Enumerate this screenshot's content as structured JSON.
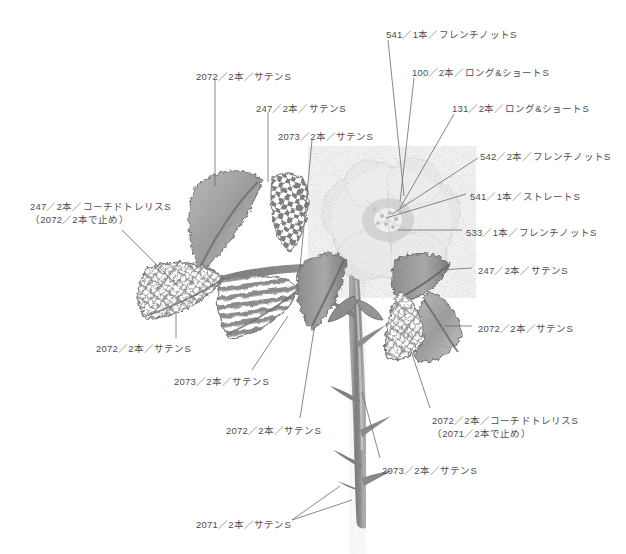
{
  "document": {
    "title": "刺繍図案 ステッチ指定図",
    "background_color": "#ffffff",
    "text_color": "#4e4e4e",
    "leader_line_color": "#6b6b6b"
  },
  "artwork": {
    "subject": "rose-embroidery-illustration",
    "palette": {
      "leaf_dark": "#7c7c7c",
      "leaf_mid": "#9a9a9a",
      "leaf_light": "#b8b8b8",
      "stem": "#8e8e8e",
      "flower_pale": "#f0f0f0",
      "flower_shadow": "#d8d8d8",
      "outline": "#6e6e6e"
    },
    "elements": [
      {
        "name": "flower-bloom",
        "stitch_ref": "100 / 131 / 541 / 542 / 533"
      },
      {
        "name": "leaf-upper-left-satin",
        "stitch_ref": "2072"
      },
      {
        "name": "leaf-checkered-upper",
        "stitch_ref": "247"
      },
      {
        "name": "leaf-trellis-left",
        "stitch_ref": "247 (2072)"
      },
      {
        "name": "leaf-striped-center",
        "stitch_ref": "2073"
      },
      {
        "name": "leaf-center-satin",
        "stitch_ref": "2072"
      },
      {
        "name": "leaf-right-upper-satin",
        "stitch_ref": "247"
      },
      {
        "name": "leaf-right-lower-satin",
        "stitch_ref": "2072"
      },
      {
        "name": "leaf-trellis-right",
        "stitch_ref": "2072 (2071)"
      },
      {
        "name": "stem-main",
        "stitch_ref": "2073"
      },
      {
        "name": "thorns",
        "stitch_ref": "2071"
      }
    ]
  },
  "labels": [
    {
      "id": "label-541-french-knot",
      "name": "label-541-french-knot",
      "line1": "541／1本／フレンチノットS",
      "color_no": "541",
      "strands": "1本",
      "stitch": "フレンチノットS",
      "x": 386,
      "y": 28
    },
    {
      "id": "label-100-long-short",
      "name": "label-100-long-and-short",
      "line1": "100／2本／ロング&ショートS",
      "color_no": "100",
      "strands": "2本",
      "stitch": "ロング&ショートS",
      "x": 412,
      "y": 66
    },
    {
      "id": "label-131-long-short",
      "name": "label-131-long-and-short",
      "line1": "131／2本／ロング&ショートS",
      "color_no": "131",
      "strands": "2本",
      "stitch": "ロング&ショートS",
      "x": 452,
      "y": 102
    },
    {
      "id": "label-542-french-knot",
      "name": "label-542-french-knot",
      "line1": "542／2本／フレンチノットS",
      "color_no": "542",
      "strands": "2本",
      "stitch": "フレンチノットS",
      "x": 480,
      "y": 150
    },
    {
      "id": "label-541-straight",
      "name": "label-541-straight",
      "line1": "541／1本／ストレートS",
      "color_no": "541",
      "strands": "1本",
      "stitch": "ストレートS",
      "x": 470,
      "y": 190
    },
    {
      "id": "label-533-french-knot",
      "name": "label-533-french-knot",
      "line1": "533／1本／フレンチノットS",
      "color_no": "533",
      "strands": "1本",
      "stitch": "フレンチノットS",
      "x": 466,
      "y": 226
    },
    {
      "id": "label-2072-upper-left",
      "name": "label-2072-satin-upper-left",
      "line1": "2072／2本／サテンS",
      "color_no": "2072",
      "strands": "2本",
      "stitch": "サテンS",
      "x": 196,
      "y": 70
    },
    {
      "id": "label-247-satin-upper",
      "name": "label-247-satin-upper",
      "line1": "247／2本／サテンS",
      "color_no": "247",
      "strands": "2本",
      "stitch": "サテンS",
      "x": 256,
      "y": 102
    },
    {
      "id": "label-2073-satin-upper",
      "name": "label-2073-satin-upper",
      "line1": "2073／2本／サテンS",
      "color_no": "2073",
      "strands": "2本",
      "stitch": "サテンS",
      "x": 278,
      "y": 130
    },
    {
      "id": "label-247-couched-trellis",
      "name": "label-247-couched-trellis",
      "line1": "247／2本／コーチドトレリスS",
      "line2": "（2072／2本で止め）",
      "color_no": "247",
      "strands": "2本",
      "stitch": "コーチドトレリスS",
      "x": 30,
      "y": 200
    },
    {
      "id": "label-247-satin-right",
      "name": "label-247-satin-right",
      "line1": "247／2本／サテンS",
      "color_no": "247",
      "strands": "2本",
      "stitch": "サテンS",
      "x": 478,
      "y": 264
    },
    {
      "id": "label-2072-satin-right",
      "name": "label-2072-satin-right",
      "line1": "2072／2本／サテンS",
      "color_no": "2072",
      "strands": "2本",
      "stitch": "サテンS",
      "x": 478,
      "y": 322
    },
    {
      "id": "label-2072-satin-lower-left",
      "name": "label-2072-satin-lower-left",
      "line1": "2072／2本／サテンS",
      "color_no": "2072",
      "strands": "2本",
      "stitch": "サテンS",
      "x": 96,
      "y": 342
    },
    {
      "id": "label-2073-satin-lower-left",
      "name": "label-2073-satin-lower-left",
      "line1": "2073／2本／サテンS",
      "color_no": "2073",
      "strands": "2本",
      "stitch": "サテンS",
      "x": 174,
      "y": 375
    },
    {
      "id": "label-2072-satin-lower-center",
      "name": "label-2072-satin-lower-center",
      "line1": "2072／2本／サテンS",
      "color_no": "2072",
      "strands": "2本",
      "stitch": "サテンS",
      "x": 226,
      "y": 424
    },
    {
      "id": "label-2072-couched-trellis",
      "name": "label-2072-couched-trellis",
      "line1": "2072／2本／コーチドトレリスS",
      "line2": "（2071／2本で止め）",
      "color_no": "2072",
      "strands": "2本",
      "stitch": "コーチドトレリスS",
      "x": 432,
      "y": 414
    },
    {
      "id": "label-2073-satin-stem",
      "name": "label-2073-satin-stem",
      "line1": "2073／2本／サテンS",
      "color_no": "2073",
      "strands": "2本",
      "stitch": "サテンS",
      "x": 382,
      "y": 464
    },
    {
      "id": "label-2071-satin-thorns",
      "name": "label-2071-satin-thorns",
      "line1": "2071／2本／サテンS",
      "color_no": "2071",
      "strands": "2本",
      "stitch": "サテンS",
      "x": 196,
      "y": 518
    }
  ]
}
